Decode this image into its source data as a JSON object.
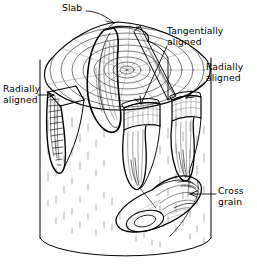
{
  "figure": {
    "kind": "technical-line-illustration",
    "background_color": "#ffffff",
    "ink_color": "#000000",
    "shading_color": "#6b6b6b"
  },
  "labels": [
    {
      "id": "slab",
      "text": "Slab",
      "x": 62,
      "y": 3,
      "align": "left",
      "leader": "line-from-text-to-upper-wedge",
      "arrow": "none"
    },
    {
      "id": "tangentially-aligned",
      "text": "Tangentially\naligned",
      "x": 167,
      "y": 26,
      "align": "left",
      "leader": "line-down-left-to-center-block",
      "arrow": "arrowhead"
    },
    {
      "id": "radially-aligned-right",
      "text": "Radially\naligned",
      "x": 206,
      "y": 62,
      "align": "left",
      "leader": "line-down-left-to-right-block",
      "arrow": "arrowhead"
    },
    {
      "id": "radially-aligned-left",
      "text": "Radially\naligned",
      "x": 3,
      "y": 84,
      "align": "left",
      "leader": "horizontal-line-right",
      "arrow": "arrowhead"
    },
    {
      "id": "cross-grain",
      "text": "Cross\ngrain",
      "x": 218,
      "y": 186,
      "align": "left",
      "leader": "horizontal-line-left",
      "arrow": "arrowhead"
    }
  ],
  "geometry": {
    "log": {
      "left_edge_x": 40,
      "right_edge_x": 211,
      "top_y": 20,
      "bottom_y": 258,
      "bottom_ellipse_ry": 20
    },
    "growth_rings_count": 9,
    "blanks": [
      {
        "name": "slab-wedge",
        "orientation": "slab",
        "position": "upper-left-cut"
      },
      {
        "name": "radial-blank-left",
        "orientation": "radially aligned",
        "position": "left"
      },
      {
        "name": "tangential-blank-center",
        "orientation": "tangentially aligned",
        "position": "center"
      },
      {
        "name": "radial-blank-right",
        "orientation": "radially aligned",
        "position": "right"
      },
      {
        "name": "cross-grain-billet",
        "orientation": "cross grain",
        "position": "lying on bottom face"
      }
    ]
  }
}
